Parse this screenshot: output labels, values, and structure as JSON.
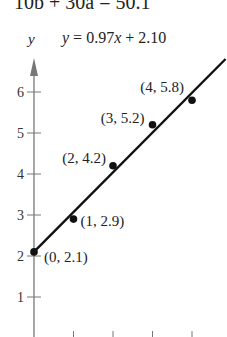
{
  "header": {
    "top_equation": "10b + 30a = 50.1",
    "y_axis_label": "y",
    "line_equation": "y = 0.97x + 2.10"
  },
  "chart_data": {
    "type": "scatter",
    "title": "y = 0.97x + 2.10",
    "xlabel": "",
    "ylabel": "y",
    "ylim": [
      0.4,
      6.9
    ],
    "xlim": [
      0,
      4.8
    ],
    "y_ticks": [
      1,
      2,
      3,
      4,
      5,
      6
    ],
    "x_ticks": [
      1,
      2,
      3,
      4
    ],
    "grid": false,
    "series": [
      {
        "name": "data points",
        "points": [
          {
            "x": 0,
            "y": 2.1,
            "label": "(0, 2.1)"
          },
          {
            "x": 1,
            "y": 2.9,
            "label": "(1, 2.9)"
          },
          {
            "x": 2,
            "y": 4.2,
            "label": "(2, 4.2)"
          },
          {
            "x": 3,
            "y": 5.2,
            "label": "(3, 5.2)"
          },
          {
            "x": 4,
            "y": 5.8,
            "label": "(4, 5.8)"
          }
        ]
      },
      {
        "name": "regression line",
        "type": "line",
        "slope": 0.97,
        "intercept": 2.1
      }
    ],
    "annotations": [
      "10b + 30a = 50.1",
      "y = 0.97x + 2.10"
    ]
  }
}
